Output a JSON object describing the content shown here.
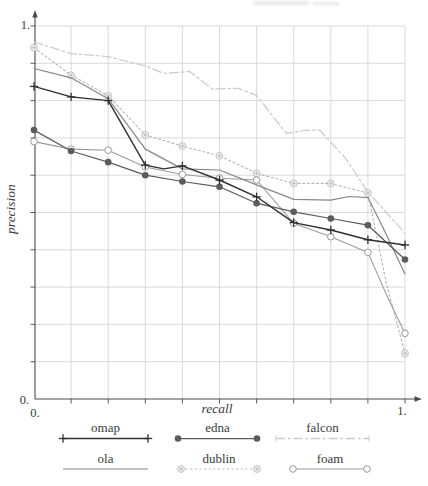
{
  "figure": {
    "y_top_label": "1.",
    "y_bottom_label": "0.",
    "x_left_label": "0.",
    "x_right_label": "1.",
    "axis_color": "#4a4a4a",
    "text_color": "#3a3a3a"
  },
  "chart_data": {
    "type": "line",
    "title": "",
    "xlabel": "recall",
    "ylabel": "precision",
    "xlim": [
      0,
      1
    ],
    "ylim": [
      0,
      1
    ],
    "grid": true,
    "grid_step": 0.1,
    "grid_color": "#d6d6d6",
    "legend_position": "below-axis, 2 rows x 3 columns",
    "series": [
      {
        "name": "omap",
        "color": "#303030",
        "line": "solid",
        "marker": "plus",
        "legend_end_marker": "plus",
        "width": 1.4,
        "points": [
          [
            0,
            0.838
          ],
          [
            0.1,
            0.81
          ],
          [
            0.2,
            0.8
          ],
          [
            0.3,
            0.627
          ],
          [
            0.35,
            0.617
          ],
          [
            0.4,
            0.625
          ],
          [
            0.5,
            0.587
          ],
          [
            0.6,
            0.542
          ],
          [
            0.7,
            0.473
          ],
          [
            0.8,
            0.453
          ],
          [
            0.9,
            0.427
          ],
          [
            1,
            0.413
          ]
        ]
      },
      {
        "name": "edna",
        "color": "#5c5c5c",
        "line": "solid",
        "marker": "filled-circle",
        "legend_end_marker": "filled-circle",
        "width": 1.25,
        "points": [
          [
            0,
            0.721
          ],
          [
            0.1,
            0.665
          ],
          [
            0.2,
            0.635
          ],
          [
            0.3,
            0.6
          ],
          [
            0.4,
            0.583
          ],
          [
            0.5,
            0.569
          ],
          [
            0.6,
            0.525
          ],
          [
            0.7,
            0.502
          ],
          [
            0.8,
            0.484
          ],
          [
            0.9,
            0.466
          ],
          [
            1,
            0.374
          ]
        ]
      },
      {
        "name": "falcon",
        "color": "#cccccc",
        "line": "dash-dot",
        "marker": "none",
        "legend_end_marker": "tick",
        "width": 1.3,
        "points": [
          [
            0,
            0.957
          ],
          [
            0.1,
            0.926
          ],
          [
            0.2,
            0.918
          ],
          [
            0.3,
            0.893
          ],
          [
            0.35,
            0.873
          ],
          [
            0.42,
            0.878
          ],
          [
            0.48,
            0.831
          ],
          [
            0.55,
            0.833
          ],
          [
            0.6,
            0.814
          ],
          [
            0.68,
            0.712
          ],
          [
            0.73,
            0.72
          ],
          [
            0.77,
            0.721
          ],
          [
            0.84,
            0.645
          ],
          [
            0.9,
            0.555
          ],
          [
            1,
            0.445
          ]
        ]
      },
      {
        "name": "ola",
        "color": "#878787",
        "line": "solid",
        "marker": "none",
        "legend_end_marker": "none",
        "width": 1.2,
        "points": [
          [
            0,
            0.886
          ],
          [
            0.1,
            0.861
          ],
          [
            0.2,
            0.805
          ],
          [
            0.3,
            0.67
          ],
          [
            0.4,
            0.617
          ],
          [
            0.5,
            0.614
          ],
          [
            0.6,
            0.574
          ],
          [
            0.7,
            0.535
          ],
          [
            0.8,
            0.533
          ],
          [
            0.85,
            0.543
          ],
          [
            0.9,
            0.54
          ],
          [
            0.94,
            0.461
          ],
          [
            1,
            0.335
          ]
        ]
      },
      {
        "name": "dublin",
        "color": "#b5b5b5",
        "line": "dotted",
        "marker": "circled-asterisk",
        "legend_end_marker": "circled-asterisk",
        "width": 1.1,
        "points": [
          [
            0,
            0.942
          ],
          [
            0.1,
            0.868
          ],
          [
            0.2,
            0.813
          ],
          [
            0.3,
            0.708
          ],
          [
            0.4,
            0.678
          ],
          [
            0.5,
            0.652
          ],
          [
            0.6,
            0.605
          ],
          [
            0.7,
            0.578
          ],
          [
            0.8,
            0.578
          ],
          [
            0.9,
            0.552
          ],
          [
            0.95,
            0.31
          ],
          [
            1,
            0.122
          ]
        ]
      },
      {
        "name": "foam",
        "color": "#9b9b9b",
        "line": "solid",
        "marker": "open-circle",
        "legend_end_marker": "open-circle",
        "width": 1.1,
        "points": [
          [
            0,
            0.69
          ],
          [
            0.1,
            0.67
          ],
          [
            0.2,
            0.667
          ],
          [
            0.3,
            0.622
          ],
          [
            0.4,
            0.602
          ],
          [
            0.5,
            0.592
          ],
          [
            0.6,
            0.587
          ],
          [
            0.7,
            0.471
          ],
          [
            0.8,
            0.435
          ],
          [
            0.9,
            0.393
          ],
          [
            0.95,
            0.28
          ],
          [
            1,
            0.176
          ]
        ]
      }
    ]
  }
}
